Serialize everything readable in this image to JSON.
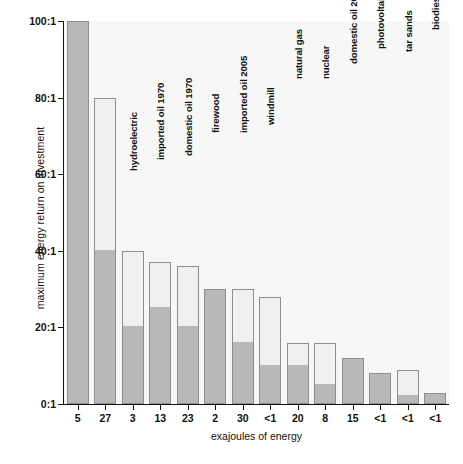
{
  "chart_data": {
    "type": "bar",
    "title": "",
    "subtitle": "",
    "xlabel": "exajoules of energy",
    "ylabel": "maximum energy return on investment",
    "ylim": [
      0,
      100
    ],
    "yticks": [
      "0:1",
      "20:1",
      "40:1",
      "60:1",
      "80:1",
      "100:1"
    ],
    "ytick_values": [
      0,
      20,
      40,
      60,
      80,
      100
    ],
    "grid": false,
    "legend": "none",
    "stacked": true,
    "series": [
      {
        "name": "lower-range return (dark)",
        "color": "#b8b8b8"
      },
      {
        "name": "upper-range return (light)",
        "color": "#f0f0f0"
      }
    ],
    "categories": [
      "domestic oil 1930",
      "coal",
      "hydroelectric",
      "imported oil 1970",
      "domestic oil 1970",
      "firewood",
      "imported oil 2005",
      "windmill",
      "natural gas",
      "nuclear",
      "domestic oil 2000",
      "photovoltaic",
      "tar sands",
      "biodiesel and gasahol"
    ],
    "exajoules": [
      "5",
      "27",
      "3",
      "13",
      "23",
      "2",
      "30",
      "<1",
      "20",
      "8",
      "15",
      "<1",
      "<1",
      "<1"
    ],
    "bars": [
      {
        "label": "domestic oil 1930",
        "exajoules": "5",
        "max": 100,
        "dark_top": 100
      },
      {
        "label": "coal",
        "exajoules": "27",
        "max": 80,
        "dark_top": 40
      },
      {
        "label": "hydroelectric",
        "exajoules": "3",
        "max": 40,
        "dark_top": 20
      },
      {
        "label": "imported oil 1970",
        "exajoules": "13",
        "max": 37,
        "dark_top": 25
      },
      {
        "label": "domestic oil 1970",
        "exajoules": "23",
        "max": 36,
        "dark_top": 20
      },
      {
        "label": "firewood",
        "exajoules": "2",
        "max": 30,
        "dark_top": 30
      },
      {
        "label": "imported oil 2005",
        "exajoules": "30",
        "max": 30,
        "dark_top": 16
      },
      {
        "label": "windmill",
        "exajoules": "<1",
        "max": 28,
        "dark_top": 10
      },
      {
        "label": "natural gas",
        "exajoules": "20",
        "max": 16,
        "dark_top": 10
      },
      {
        "label": "nuclear",
        "exajoules": "8",
        "max": 16,
        "dark_top": 5
      },
      {
        "label": "domestic oil 2000",
        "exajoules": "15",
        "max": 12,
        "dark_top": 12
      },
      {
        "label": "photovoltaic",
        "exajoules": "<1",
        "max": 8,
        "dark_top": 8
      },
      {
        "label": "tar sands",
        "exajoules": "<1",
        "max": 9,
        "dark_top": 2
      },
      {
        "label": "biodiesel and gasahol",
        "exajoules": "<1",
        "max": 3,
        "dark_top": 3
      }
    ],
    "colors": {
      "dark_fill": "#b8b8b8",
      "light_fill": "#f0f0f0",
      "bar_border": "#8f8f8f",
      "plot_background": "#f7f7f7",
      "axis": "#111111"
    }
  }
}
